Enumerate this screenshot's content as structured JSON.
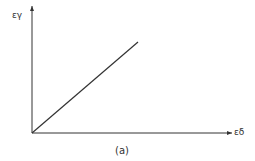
{
  "diagram": {
    "y_axis_label": "εγ",
    "x_axis_label": "εδ",
    "caption": "(a)",
    "line_color": "#333333",
    "origin": [
      32,
      133
    ],
    "line_end": [
      138,
      42
    ],
    "y_axis_top": [
      32,
      6
    ],
    "x_axis_right": [
      232,
      133
    ]
  }
}
